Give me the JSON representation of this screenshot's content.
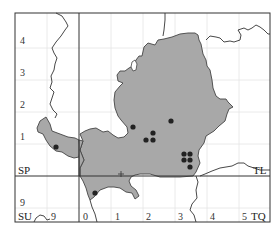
{
  "map": {
    "colors": {
      "background": "#ffffff",
      "frame": "#333333",
      "grid": "#e4e4e4",
      "region_fill": "#a8a8a8",
      "region_stroke": "#444444",
      "boundary": "#333333",
      "record_dot": "#222222"
    },
    "grid_square_labels": {
      "sp": "SP",
      "tl": "TL",
      "su": "SU",
      "tq": "TQ"
    },
    "left_axis_labels": [
      "4",
      "3",
      "2",
      "1",
      "9"
    ],
    "bottom_axis_labels": [
      "9",
      "0",
      "1",
      "2",
      "3",
      "4",
      "5"
    ],
    "record_dots": [
      {
        "x": 56,
        "y": 147
      },
      {
        "x": 133,
        "y": 127
      },
      {
        "x": 153,
        "y": 133
      },
      {
        "x": 146,
        "y": 140
      },
      {
        "x": 153,
        "y": 140
      },
      {
        "x": 171,
        "y": 121
      },
      {
        "x": 184,
        "y": 154
      },
      {
        "x": 190,
        "y": 154
      },
      {
        "x": 184,
        "y": 160
      },
      {
        "x": 190,
        "y": 160
      },
      {
        "x": 190,
        "y": 167
      },
      {
        "x": 95,
        "y": 193
      }
    ],
    "centre_marker": {
      "x": 121,
      "y": 174
    }
  }
}
